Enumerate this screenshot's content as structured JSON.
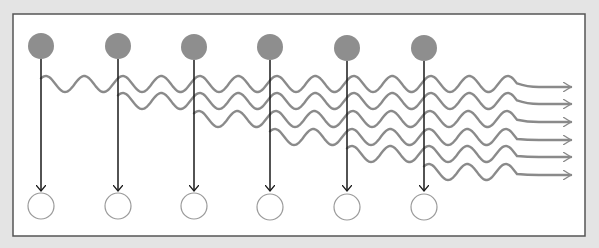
{
  "diagram": {
    "kind": "emission-sequence",
    "frame": {
      "x": 13,
      "y": 14,
      "width": 572,
      "height": 222,
      "fill": "#ffffff",
      "stroke": "#555555"
    },
    "colors": {
      "background": "#e4e4e4",
      "source_fill": "#8e8e8e",
      "target_stroke": "#9a9a9a",
      "line": "#1a1a1a",
      "wave": "#8a8a8a"
    },
    "sources": [
      {
        "id": 1,
        "x": 41,
        "y": 46,
        "r": 13
      },
      {
        "id": 2,
        "x": 118,
        "y": 46,
        "r": 13
      },
      {
        "id": 3,
        "x": 194,
        "y": 47,
        "r": 13
      },
      {
        "id": 4,
        "x": 270,
        "y": 47,
        "r": 13
      },
      {
        "id": 5,
        "x": 347,
        "y": 48,
        "r": 13
      },
      {
        "id": 6,
        "x": 424,
        "y": 48,
        "r": 13
      }
    ],
    "targets": [
      {
        "id": 1,
        "x": 41,
        "y": 206,
        "r": 13
      },
      {
        "id": 2,
        "x": 118,
        "y": 206,
        "r": 13
      },
      {
        "id": 3,
        "x": 194,
        "y": 206,
        "r": 13
      },
      {
        "id": 4,
        "x": 270,
        "y": 207,
        "r": 13
      },
      {
        "id": 5,
        "x": 347,
        "y": 207,
        "r": 13
      },
      {
        "id": 6,
        "x": 424,
        "y": 207,
        "r": 13
      }
    ],
    "arrow_tip_y": 191,
    "waves": [
      {
        "id": 1,
        "start_x": 41,
        "center_y": 84,
        "end_y": 87
      },
      {
        "id": 2,
        "start_x": 118,
        "center_y": 101,
        "end_y": 104
      },
      {
        "id": 3,
        "start_x": 194,
        "center_y": 119,
        "end_y": 122
      },
      {
        "id": 4,
        "start_x": 270,
        "center_y": 137,
        "end_y": 140
      },
      {
        "id": 5,
        "start_x": 347,
        "center_y": 154,
        "end_y": 157
      },
      {
        "id": 6,
        "start_x": 424,
        "center_y": 172,
        "end_y": 175
      }
    ],
    "wave_params": {
      "wavelength": 38.5,
      "amplitude": 8,
      "wave_end_x": 517,
      "arrow_end_x": 571
    }
  }
}
